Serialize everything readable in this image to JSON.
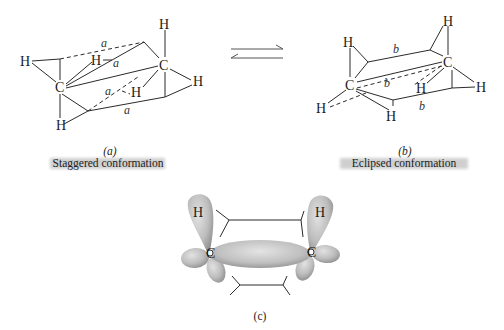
{
  "equilibrium_arrow": {
    "icon": "equilibrium-arrows-icon"
  },
  "panel_a": {
    "tag": "(a)",
    "caption": "Staggered conformation",
    "atoms": {
      "carbon": "C",
      "hydrogen": "H"
    },
    "distance_label": "a"
  },
  "panel_b": {
    "tag": "(b)",
    "caption": "Eclipsed conformation",
    "atoms": {
      "carbon": "C",
      "hydrogen": "H"
    },
    "distance_label": "b"
  },
  "panel_c": {
    "tag": "(c)",
    "atoms": {
      "carbon": "C",
      "hydrogen": "H"
    }
  },
  "colors": {
    "orbital_fill": "#c8c8c8",
    "orbital_shade": "#8e8e8e",
    "caption_shadow": "#a9a9a9",
    "line": "#2a2a2a"
  }
}
